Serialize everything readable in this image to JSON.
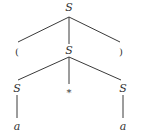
{
  "diagram": {
    "type": "parse-tree",
    "nodes": {
      "root": "S",
      "lparen": "(",
      "mid": "S",
      "rparen": ")",
      "left_s": "S",
      "star": "*",
      "right_s": "S",
      "left_a": "a",
      "right_a": "a"
    },
    "colors": {
      "line": "#3a3a3a",
      "text": "#333333",
      "background": "#ffffff"
    }
  }
}
